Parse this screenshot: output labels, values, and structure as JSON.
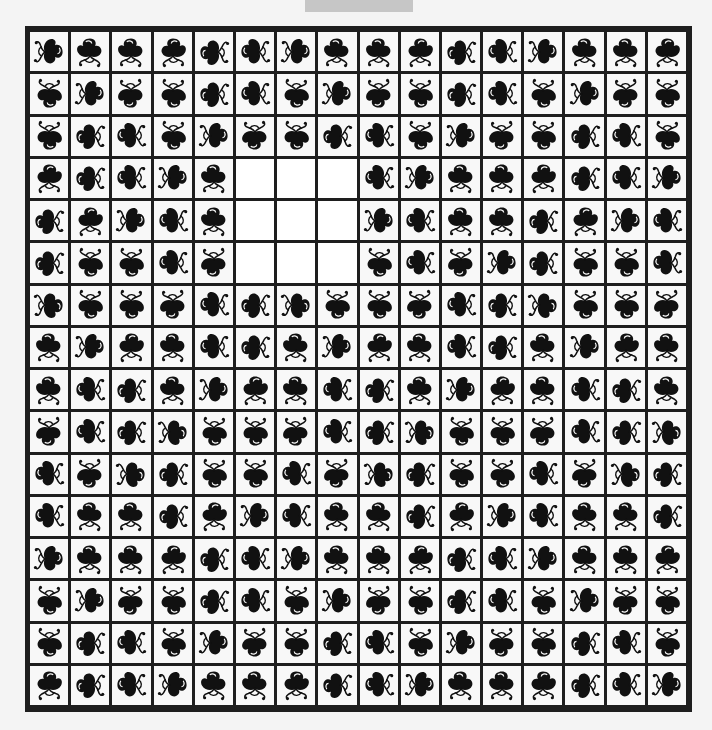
{
  "title": "",
  "board": {
    "rows": 16,
    "cols": 16,
    "empty_cells": [
      [
        3,
        5
      ],
      [
        3,
        6
      ],
      [
        3,
        7
      ],
      [
        4,
        5
      ],
      [
        4,
        6
      ],
      [
        4,
        7
      ],
      [
        5,
        5
      ],
      [
        5,
        6
      ],
      [
        5,
        7
      ]
    ],
    "legend": {
      "S1": "tendrils-down",
      "S2": "tendrils-down-mirrored",
      "N1": "tendrils-up",
      "N2": "tendrils-up-mirrored",
      "E1": "tendrils-right",
      "E2": "tendrils-right-mirrored",
      "W1": "tendrils-left",
      "W2": "tendrils-left-mirrored",
      "": "empty"
    },
    "tiles": [
      [
        "W1",
        "S1",
        "S1",
        "S2",
        "E1",
        "E2",
        "W1",
        "S1",
        "S1",
        "S2",
        "E1",
        "E2",
        "W1",
        "S1",
        "S1",
        "S2"
      ],
      [
        "N1",
        "W1",
        "N2",
        "N1",
        "E1",
        "E2",
        "N1",
        "W1",
        "N2",
        "N1",
        "E1",
        "E2",
        "N1",
        "W1",
        "N2",
        "N1"
      ],
      [
        "N1",
        "E1",
        "E2",
        "N1",
        "W1",
        "N2",
        "N1",
        "E1",
        "E2",
        "N1",
        "W1",
        "N2",
        "N1",
        "E1",
        "E2",
        "N1"
      ],
      [
        "S2",
        "E1",
        "E2",
        "W1",
        "S1",
        "",
        "",
        "",
        "E2",
        "W1",
        "S1",
        "S1",
        "S2",
        "E1",
        "E2",
        "W1"
      ],
      [
        "E1",
        "S2",
        "W1",
        "E2",
        "S1",
        "",
        "",
        "",
        "W1",
        "E2",
        "S1",
        "S1",
        "E1",
        "S2",
        "W1",
        "E2"
      ],
      [
        "E1",
        "N1",
        "N1",
        "E2",
        "N2",
        "",
        "",
        "",
        "N1",
        "E2",
        "N2",
        "W1",
        "E1",
        "N1",
        "N1",
        "E2"
      ],
      [
        "W2",
        "N1",
        "N1",
        "N2",
        "E2",
        "E1",
        "W2",
        "N1",
        "N1",
        "N2",
        "E2",
        "E1",
        "W2",
        "N1",
        "N1",
        "N2"
      ],
      [
        "S1",
        "W1",
        "S2",
        "S1",
        "E2",
        "E1",
        "S1",
        "W1",
        "S2",
        "S1",
        "E2",
        "E1",
        "S1",
        "W1",
        "S2",
        "S1"
      ],
      [
        "S1",
        "E2",
        "E1",
        "S1",
        "W1",
        "S2",
        "S1",
        "E2",
        "E1",
        "S1",
        "W1",
        "S2",
        "S1",
        "E2",
        "E1",
        "S1"
      ],
      [
        "N2",
        "E2",
        "E1",
        "W2",
        "N1",
        "N1",
        "N2",
        "E2",
        "E1",
        "W2",
        "N1",
        "N1",
        "N2",
        "E2",
        "E1",
        "W2"
      ],
      [
        "E2",
        "N2",
        "W2",
        "E1",
        "N1",
        "N1",
        "E2",
        "N2",
        "W2",
        "E1",
        "N1",
        "N1",
        "E2",
        "N2",
        "W2",
        "E1"
      ],
      [
        "E2",
        "S1",
        "S1",
        "E1",
        "S2",
        "W1",
        "E2",
        "S1",
        "S1",
        "E1",
        "S2",
        "W1",
        "E2",
        "S1",
        "S1",
        "E1"
      ],
      [
        "W1",
        "S1",
        "S1",
        "S2",
        "E1",
        "E2",
        "W1",
        "S1",
        "S1",
        "S2",
        "E1",
        "E2",
        "W1",
        "S1",
        "S1",
        "S2"
      ],
      [
        "N1",
        "W1",
        "N2",
        "N1",
        "E1",
        "E2",
        "N1",
        "W1",
        "N2",
        "N1",
        "E1",
        "E2",
        "N1",
        "W1",
        "N2",
        "N1"
      ],
      [
        "N1",
        "E1",
        "E2",
        "N1",
        "W1",
        "N2",
        "N1",
        "E1",
        "E2",
        "N1",
        "W1",
        "N2",
        "N1",
        "E1",
        "E2",
        "N1"
      ],
      [
        "S2",
        "E1",
        "E2",
        "W1",
        "S1",
        "S1",
        "S2",
        "E1",
        "E2",
        "W1",
        "S1",
        "S1",
        "S2",
        "E1",
        "E2",
        "W1"
      ]
    ]
  },
  "colors": {
    "board_border": "#1e1e1e",
    "tile_bg": "#f8f8f8",
    "glyph": "#111111",
    "page_bg": "#f4f4f4",
    "title_tab_bg": "#c6c6c6"
  }
}
